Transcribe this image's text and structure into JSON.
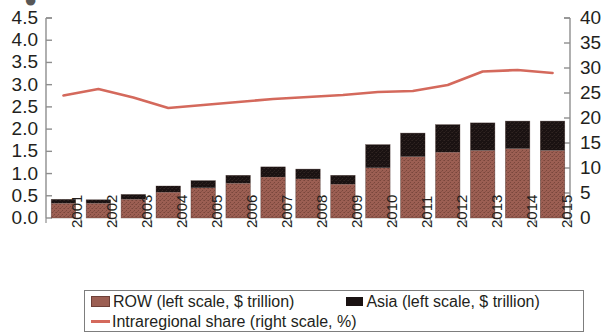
{
  "chart_data": {
    "type": "bar",
    "title": "",
    "subtitle": "",
    "xlabel": "",
    "ylabel": "",
    "y2label": "",
    "grid": false,
    "legend_position": "bottom",
    "categories": [
      "2001",
      "2002",
      "2003",
      "2004",
      "2005",
      "2006",
      "2007",
      "2008",
      "2009",
      "2010",
      "2011",
      "2012",
      "2013",
      "2014",
      "2015"
    ],
    "ylim": [
      0.0,
      4.5
    ],
    "y2lim": [
      0,
      40
    ],
    "yticks": [
      "4.5",
      "4.0",
      "3.5",
      "3.0",
      "2.5",
      "2.0",
      "1.5",
      "1.0",
      "0.5",
      "0.0"
    ],
    "y2ticks": [
      "40",
      "35",
      "30",
      "25",
      "20",
      "15",
      "10",
      "5",
      "0"
    ],
    "stacked": true,
    "series": [
      {
        "name": "ROW (left scale, $ trillion)",
        "axis": "left",
        "kind": "bar",
        "color": "#9c5f53",
        "values": [
          0.33,
          0.33,
          0.42,
          0.58,
          0.68,
          0.78,
          0.92,
          0.88,
          0.76,
          1.13,
          1.38,
          1.48,
          1.52,
          1.56,
          1.52
        ]
      },
      {
        "name": "Asia (left scale, $ trillion)",
        "axis": "left",
        "kind": "bar",
        "color": "#1a1212",
        "values": [
          0.09,
          0.08,
          0.11,
          0.14,
          0.16,
          0.18,
          0.23,
          0.22,
          0.2,
          0.52,
          0.53,
          0.62,
          0.62,
          0.62,
          0.66
        ]
      },
      {
        "name": "Intraregional share  (right scale, %)",
        "axis": "right",
        "kind": "line",
        "color": "#d4695c",
        "values": [
          24.5,
          25.8,
          24.1,
          22.0,
          22.6,
          23.2,
          23.8,
          24.2,
          24.6,
          25.2,
          25.4,
          26.6,
          29.3,
          29.6,
          29.0
        ]
      }
    ]
  },
  "legend": {
    "items": [
      {
        "label": "ROW (left scale, $ trillion)",
        "marker": "square-swatch",
        "color": "#9c5f53"
      },
      {
        "label": "Asia (left scale, $ trillion)",
        "marker": "square-swatch",
        "color": "#1a1212"
      },
      {
        "label": "Intraregional share  (right scale, %)",
        "marker": "line-swatch",
        "color": "#d4695c"
      }
    ]
  },
  "colors": {
    "row_bar": "#9c5f53",
    "asia_bar": "#1a1212",
    "line": "#d4695c",
    "axis": "#8e8e8e",
    "text": "#231f20",
    "legend_border": "#7d7d7d"
  }
}
